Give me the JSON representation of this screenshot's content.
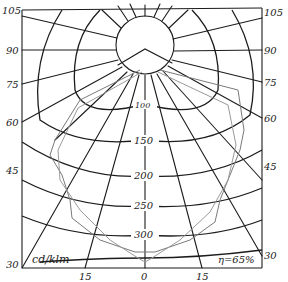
{
  "diagram": {
    "unit_label": "cd/klm",
    "efficiency_label": "η=65%",
    "left_angle_labels": [
      "105",
      "90",
      "75",
      "60",
      "45",
      "30"
    ],
    "right_angle_labels": [
      "105",
      "90",
      "75",
      "60",
      "45",
      "30"
    ],
    "bottom_angle_labels": [
      "15",
      "0",
      "15"
    ],
    "intensity_labels": [
      "100",
      "150",
      "200",
      "250",
      "300"
    ],
    "colors": {
      "grid": "#1c1c1c",
      "curve_primary": "#7a7a7a",
      "curve_secondary": "#9a9a9a",
      "background": "#ffffff"
    }
  }
}
